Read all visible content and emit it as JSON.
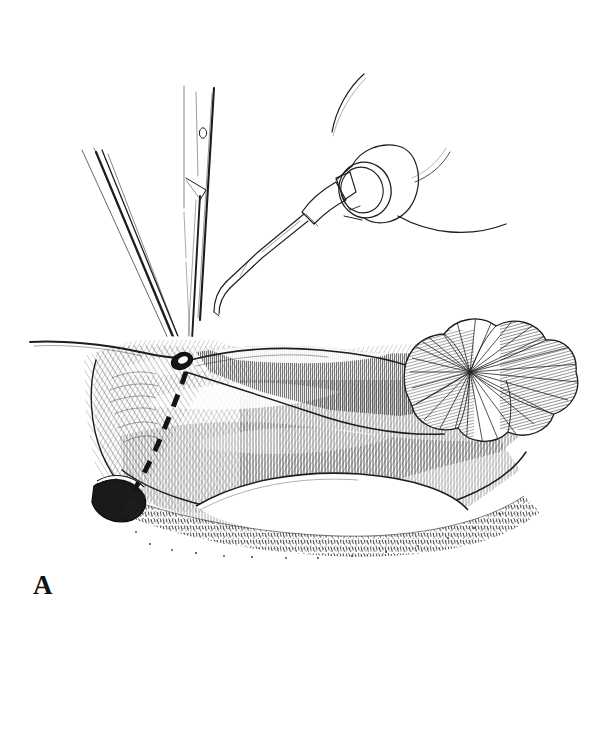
{
  "figure": {
    "panel_label": "A",
    "caption": "",
    "background_color": "#ffffff",
    "ink_color": "#1a1a1a",
    "line_color": "#222222",
    "shade_color": "#555555",
    "width": 610,
    "height": 744,
    "medium": "pen-and-ink line drawing"
  },
  "instruments": [
    {
      "id": "forceps",
      "name": "tissue-forceps",
      "label": "Forceps",
      "position": "upper-left",
      "description": "Two slender converging prongs entering from upper left, tips meeting at the grasped tissue point"
    },
    {
      "id": "scalpel",
      "name": "scalpel-blade",
      "label": "Scalpel",
      "position": "upper-center",
      "description": "Straight blade shaft with small oval fenestration and beveled cutting tip, pointing down"
    },
    {
      "id": "cautery",
      "name": "cautery-handpiece",
      "label": "Cautery",
      "position": "upper-right",
      "description": "Conical tipped handpiece with cylindrical collar and trailing cables"
    }
  ],
  "anatomy": [
    {
      "id": "tissue-flap",
      "name": "tissue-flap",
      "label": "Tissue flap",
      "description": "Large elevated flap with dense parallel hatch shading forming the body of the field"
    },
    {
      "id": "dashed-incision",
      "name": "dashed-incision-line",
      "label": "Planned incision",
      "description": "Bold dashed line marking the intended incision, running down-left from the grasped apex"
    },
    {
      "id": "grasp-point",
      "name": "grasp-point",
      "label": "Grasped point",
      "description": "Dark oval where forceps tips pinch the tissue edge"
    },
    {
      "id": "lobulated-mass",
      "name": "lobulated-mass",
      "label": "Lobulated mass",
      "description": "Rounded multi-lobed structure with radiating hatch lines at the right of the field"
    },
    {
      "id": "pale-cavity",
      "name": "pale-cavity",
      "label": "Exposed surface",
      "description": "Pale unshaded oval region beneath the flap"
    },
    {
      "id": "dark-recess",
      "name": "dark-recess",
      "label": "Deep recess",
      "description": "Heavily inked dark pocket at lower left of the field"
    },
    {
      "id": "stippled-margin",
      "name": "stippled-margin",
      "label": "Wound margin",
      "description": "Stippled and short-stroke textured border along the lower edge"
    }
  ]
}
